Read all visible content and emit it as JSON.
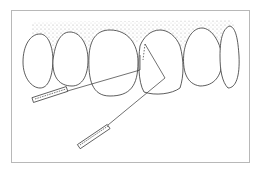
{
  "figure": {
    "colors": {
      "line": "#333333",
      "gingiva_stipple": "#9a9a9a",
      "frame": "#b8b8b8",
      "background": "#ffffff"
    },
    "teeth_count": 6,
    "instruments": [
      "probe-left",
      "probe-lower"
    ]
  }
}
